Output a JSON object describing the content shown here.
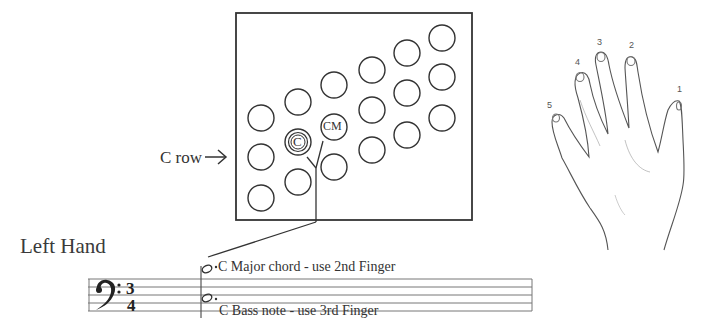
{
  "diagram": {
    "title": "Left Hand",
    "button_grid": {
      "row_indicator": {
        "label": "C row",
        "arrow": "right-arrow-icon"
      },
      "labeled_buttons": [
        {
          "id": "C",
          "label": "C",
          "style": "double-circle"
        },
        {
          "id": "CM",
          "label": "CM",
          "style": "single-circle"
        }
      ],
      "columns": 6,
      "rows": 3
    },
    "staff": {
      "clef": "bass",
      "time_signature": {
        "top": "3",
        "bottom": "4"
      },
      "notes": [
        {
          "label": "C Major chord - use 2nd Finger",
          "position": "upper"
        },
        {
          "label": "C Bass note - use 3rd Finger",
          "position": "lower"
        }
      ]
    },
    "hand": {
      "finger_labels": [
        "1",
        "2",
        "3",
        "4",
        "5"
      ]
    }
  }
}
